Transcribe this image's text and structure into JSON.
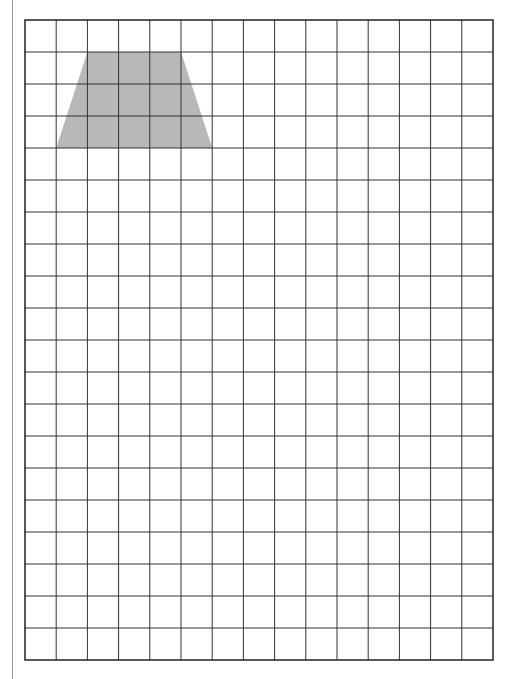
{
  "diagram": {
    "type": "grid-worksheet",
    "grid": {
      "columns": 15,
      "rows": 20,
      "origin_x": 25,
      "origin_y": 20,
      "cell_width": 31.2,
      "cell_height": 32,
      "line_color": "#333333",
      "border_color": "#222222"
    },
    "shapes": [
      {
        "name": "trapezoid",
        "fill": "#b8b8b8",
        "grid_points": [
          [
            2,
            1
          ],
          [
            5,
            1
          ],
          [
            6,
            4
          ],
          [
            1,
            4
          ]
        ],
        "description": "Isosceles trapezoid: top base 3 units, bottom base 5 units, height 3 units"
      }
    ],
    "margin_line_color": "#9a9a9a"
  }
}
